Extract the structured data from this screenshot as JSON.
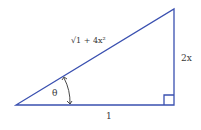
{
  "diagram": {
    "type": "right-triangle",
    "line_color": "#3a50b0",
    "label_color": "#3a3a3a",
    "vertices": {
      "bottom_left": [
        16,
        105
      ],
      "bottom_right": [
        174,
        105
      ],
      "top_right": [
        174,
        9
      ]
    },
    "labels": {
      "hypotenuse": "√1 + 4x²",
      "vertical_side": "2x",
      "base": "1",
      "angle": "θ"
    },
    "right_angle_marker": true,
    "angle_arc_with_arrows": true
  }
}
